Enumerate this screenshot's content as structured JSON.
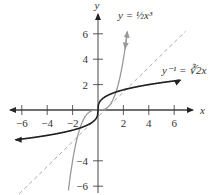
{
  "chart_data": {
    "type": "line",
    "title": "",
    "xlabel": "x",
    "ylabel": "y",
    "xlim": [
      -7,
      7.5
    ],
    "ylim": [
      -7,
      8
    ],
    "x_ticks": [
      -6,
      -4,
      -2,
      2,
      4,
      6
    ],
    "y_ticks": [
      6,
      4,
      2,
      -4,
      -6
    ],
    "x_tick_labels": [
      "−6",
      "−4",
      "−2",
      "2",
      "4",
      "6"
    ],
    "y_tick_labels": [
      "6",
      "4",
      "2",
      "−4",
      "−6"
    ],
    "grid": false,
    "series": [
      {
        "name": "y = ½x³",
        "function": "0.5*x^3",
        "color": "#9a9a9a",
        "style": "solid",
        "domain": [
          -2.3,
          2.3
        ]
      },
      {
        "name": "y⁻¹ = ∛(2x)",
        "function": "cbrt(2x)",
        "color": "#222222",
        "style": "solid",
        "domain": [
          -6.5,
          6.5
        ]
      },
      {
        "name": "y = x",
        "function": "x",
        "color": "#aaaaaa",
        "style": "dashed",
        "domain": [
          -7,
          7
        ]
      }
    ],
    "annotations": [
      {
        "text": "y = ½x³",
        "near": [
          2,
          7
        ]
      },
      {
        "text": "y⁻¹ = ∛2x",
        "near": [
          5.5,
          2.5
        ]
      }
    ]
  },
  "labels": {
    "x_axis": "x",
    "y_axis": "y",
    "cubic": "y = ½x³",
    "inverse": "y⁻¹ = ∛2x"
  }
}
